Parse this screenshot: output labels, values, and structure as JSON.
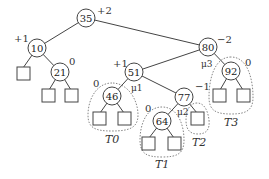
{
  "nodes": {
    "n35": {
      "key": "35",
      "balance": "+2"
    },
    "n10": {
      "key": "10",
      "balance": "+1"
    },
    "n21": {
      "key": "21",
      "balance": "0"
    },
    "n80": {
      "key": "80",
      "balance": "−2",
      "label": "μ3"
    },
    "n51": {
      "key": "51",
      "balance": "+1",
      "label": "μ1"
    },
    "n92": {
      "key": "92",
      "balance": "0"
    },
    "n46": {
      "key": "46",
      "balance": "0"
    },
    "n77": {
      "key": "77",
      "balance": "−1",
      "label": "μ2"
    },
    "n64": {
      "key": "64",
      "balance": "0"
    }
  },
  "subtrees": {
    "T0": "T0",
    "T1": "T1",
    "T2": "T2",
    "T3": "T3"
  }
}
